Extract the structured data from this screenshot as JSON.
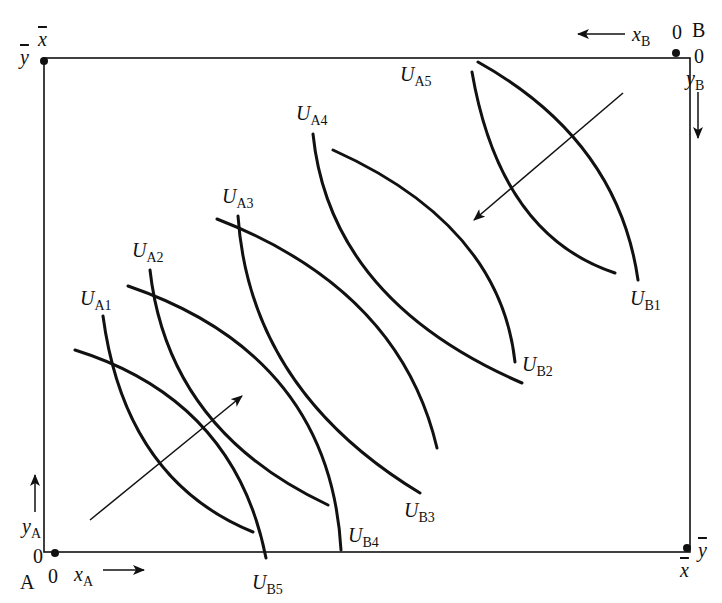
{
  "diagram": {
    "type": "edgeworth-box",
    "box": {
      "left": 44,
      "top": 52,
      "right": 690,
      "bottom": 552
    },
    "origins": {
      "A": {
        "label": "A",
        "x_zero": "0",
        "y_zero": "0",
        "x_axis": "x",
        "x_sub": "A",
        "y_axis": "y",
        "y_sub": "A"
      },
      "B": {
        "label": "B",
        "x_zero": "0",
        "y_zero": "0",
        "x_axis": "x",
        "x_sub": "B",
        "y_axis": "y",
        "y_sub": "B"
      }
    },
    "corners": {
      "top_left_x": "x",
      "top_left_y": "y",
      "bottom_right_x": "x",
      "bottom_right_y": "y"
    },
    "curves_A": [
      {
        "label": "U",
        "sub": "A1",
        "path": "M103,316 Q125,480 253,532"
      },
      {
        "label": "U",
        "sub": "A2",
        "path": "M150,270 Q168,430 328,505"
      },
      {
        "label": "U",
        "sub": "A3",
        "path": "M238,216 Q250,390 420,493"
      },
      {
        "label": "U",
        "sub": "A4",
        "path": "M313,134 Q330,300 522,383"
      },
      {
        "label": "U",
        "sub": "A5",
        "path": "M472,72 Q500,235 615,273"
      }
    ],
    "curves_B": [
      {
        "label": "U",
        "sub": "B1",
        "path": "M478,62 Q618,140 638,280"
      },
      {
        "label": "U",
        "sub": "B2",
        "path": "M333,150 Q500,225 515,362"
      },
      {
        "label": "U",
        "sub": "B3",
        "path": "M217,219 Q400,290 437,448"
      },
      {
        "label": "U",
        "sub": "B4",
        "path": "M128,286 Q330,355 341,550"
      },
      {
        "label": "U",
        "sub": "B5",
        "path": "M75,350 Q235,400 266,558"
      }
    ],
    "arrows": [
      {
        "name": "arrow-A-preference",
        "from": [
          90,
          520
        ],
        "to": [
          242,
          396
        ]
      },
      {
        "name": "arrow-B-preference",
        "from": [
          623,
          93
        ],
        "to": [
          474,
          220
        ]
      }
    ],
    "colors": {
      "ink": "#111111",
      "background": "#ffffff"
    }
  }
}
